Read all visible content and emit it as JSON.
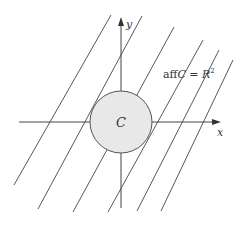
{
  "diagram": {
    "axes": {
      "x_label": "x",
      "y_label": "y"
    },
    "set": {
      "label": "C",
      "fill": "#e8e8e8",
      "stroke": "#555555"
    },
    "annotation": {
      "prefix": "aff",
      "var": "C",
      "eq": " = ",
      "space": "R",
      "exp": "2"
    },
    "line_color": "#444444",
    "parallel_lines": [
      {
        "x1": 14,
        "y1": 185,
        "x2": 111,
        "y2": 15
      },
      {
        "x1": 38,
        "y1": 209,
        "x2": 142,
        "y2": 16
      },
      {
        "x1": 73,
        "y1": 212,
        "x2": 174,
        "y2": 27
      },
      {
        "x1": 108,
        "y1": 212,
        "x2": 203,
        "y2": 40
      },
      {
        "x1": 137,
        "y1": 211,
        "x2": 219,
        "y2": 50
      },
      {
        "x1": 161,
        "y1": 211,
        "x2": 233,
        "y2": 60
      }
    ]
  }
}
